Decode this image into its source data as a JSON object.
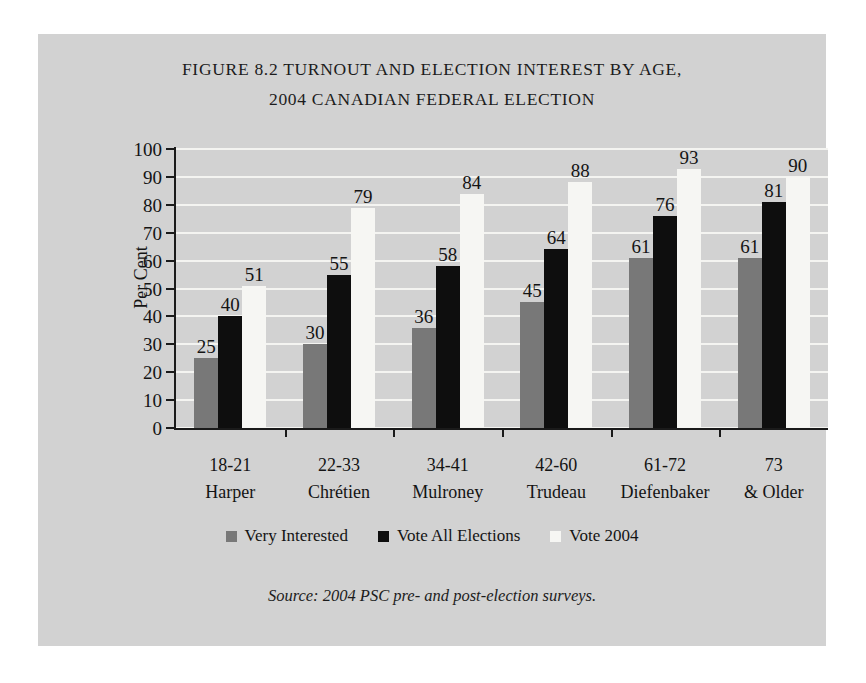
{
  "figure": {
    "title_line1": "FIGURE 8.2 TURNOUT AND ELECTION INTEREST BY AGE,",
    "title_line2": "2004 CANADIAN FEDERAL ELECTION",
    "source_note": "Source: 2004 PSC pre- and post-election surveys."
  },
  "chart_data": {
    "type": "bar",
    "title": "FIGURE 8.2 TURNOUT AND ELECTION INTEREST BY AGE, 2004 CANADIAN FEDERAL ELECTION",
    "xlabel": "",
    "ylabel": "Per Cent",
    "ylim": [
      0,
      100
    ],
    "ytick_labels": [
      "0",
      "10",
      "20",
      "30",
      "40",
      "50",
      "60",
      "70",
      "80",
      "90",
      "100"
    ],
    "ytick_values": [
      0,
      10,
      20,
      30,
      40,
      50,
      60,
      70,
      80,
      90,
      100
    ],
    "grid": true,
    "grid_axis": "y",
    "legend_position": "bottom",
    "categories": [
      "18-21\nHarper",
      "22-33\nChrétien",
      "34-41\nMulroney",
      "42-60\nTrudeau",
      "61-72\nDiefenbaker",
      "73\n& Older"
    ],
    "category_lines": [
      [
        "18-21",
        "Harper"
      ],
      [
        "22-33",
        "Chrétien"
      ],
      [
        "34-41",
        "Mulroney"
      ],
      [
        "42-60",
        "Trudeau"
      ],
      [
        "61-72",
        "Diefenbaker"
      ],
      [
        "73",
        "& Older"
      ]
    ],
    "series": [
      {
        "name": "Very Interested",
        "color": "#787878",
        "values": [
          25,
          30,
          36,
          45,
          61,
          61
        ]
      },
      {
        "name": "Vote All Elections",
        "color": "#0e0e0e",
        "values": [
          40,
          55,
          58,
          64,
          76,
          81
        ]
      },
      {
        "name": "Vote 2004",
        "color": "#f6f6f3",
        "values": [
          51,
          79,
          84,
          88,
          93,
          90
        ]
      }
    ],
    "data_labels": true,
    "annotations": [
      "Source: 2004 PSC pre- and post-election surveys."
    ]
  },
  "colors": {
    "page_background": "#ffffff",
    "panel_background": "#d2d2d2",
    "plot_background": "#d2d2d2",
    "gridline": "#f4f4f1",
    "axis": "#1a1a1a",
    "text": "#141414"
  }
}
